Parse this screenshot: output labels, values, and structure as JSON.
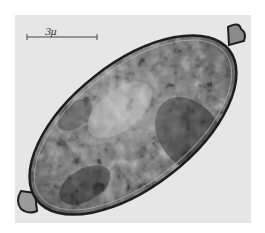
{
  "image": {
    "subject": "microscope photograph of an elongated egg (ovum) with polar knobs",
    "background_color": "#e6e6e6",
    "scale_bar": {
      "label": "3μ"
    }
  },
  "colors": {
    "shell_outline": "#1e1e1e",
    "interior_dark": "#2a2a2a",
    "interior_mid": "#7a7a7a",
    "interior_light": "#d8d8d8"
  }
}
